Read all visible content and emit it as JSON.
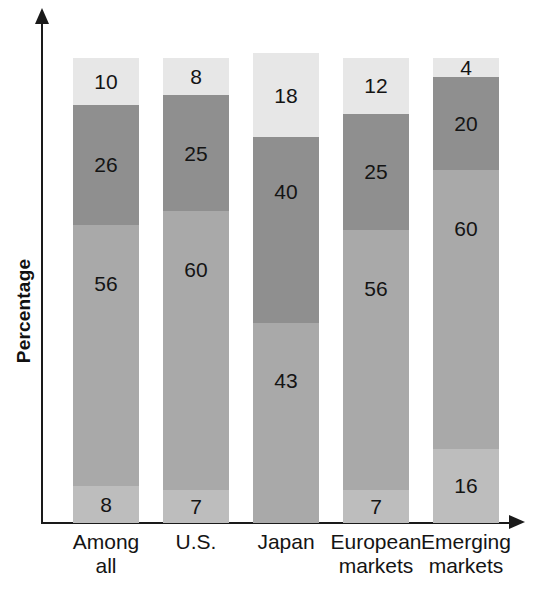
{
  "chart": {
    "type": "bar",
    "title": "",
    "ylabel": "Percentage",
    "xlabel": ""
  },
  "chart_data": {
    "type": "bar",
    "title": "",
    "xlabel": "",
    "ylabel": "Percentage",
    "ylim": [
      0,
      100
    ],
    "grid": false,
    "legend": "none",
    "stacked": true,
    "categories": [
      "Among\nall",
      "U.S.",
      "Japan",
      "European\nmarkets",
      "Emerging\nmarkets"
    ],
    "series": [
      {
        "name": "segment-1-bottom",
        "values": [
          8,
          7,
          0,
          7,
          16
        ],
        "color": "#bdbdbd"
      },
      {
        "name": "segment-2",
        "values": [
          56,
          60,
          43,
          56,
          60
        ],
        "color": "#a9a9a9"
      },
      {
        "name": "segment-3",
        "values": [
          26,
          25,
          40,
          25,
          20
        ],
        "color": "#8f8f8f"
      },
      {
        "name": "segment-4-top",
        "values": [
          10,
          8,
          18,
          12,
          4
        ],
        "color": "#e7e7e7"
      }
    ],
    "bars": [
      {
        "category": "Among\nall",
        "line1": "Among",
        "line2": "all",
        "total": 100,
        "segments": [
          {
            "value": 10,
            "label": "10",
            "color": "#e7e7e7"
          },
          {
            "value": 26,
            "label": "26",
            "color": "#8f8f8f"
          },
          {
            "value": 56,
            "label": "56",
            "color": "#a9a9a9"
          },
          {
            "value": 8,
            "label": "8",
            "color": "#bdbdbd"
          }
        ]
      },
      {
        "category": "U.S.",
        "line1": "U.S.",
        "line2": "",
        "total": 100,
        "segments": [
          {
            "value": 8,
            "label": "8",
            "color": "#e7e7e7"
          },
          {
            "value": 25,
            "label": "25",
            "color": "#8f8f8f"
          },
          {
            "value": 60,
            "label": "60",
            "color": "#a9a9a9"
          },
          {
            "value": 7,
            "label": "7",
            "color": "#bdbdbd"
          }
        ]
      },
      {
        "category": "Japan",
        "line1": "Japan",
        "line2": "",
        "total": 101,
        "segments": [
          {
            "value": 18,
            "label": "18",
            "color": "#e7e7e7"
          },
          {
            "value": 40,
            "label": "40",
            "color": "#8f8f8f"
          },
          {
            "value": 43,
            "label": "43",
            "color": "#a9a9a9"
          }
        ]
      },
      {
        "category": "European\nmarkets",
        "line1": "European",
        "line2": "markets",
        "total": 100,
        "segments": [
          {
            "value": 12,
            "label": "12",
            "color": "#e7e7e7"
          },
          {
            "value": 25,
            "label": "25",
            "color": "#8f8f8f"
          },
          {
            "value": 56,
            "label": "56",
            "color": "#a9a9a9"
          },
          {
            "value": 7,
            "label": "7",
            "color": "#bdbdbd"
          }
        ]
      },
      {
        "category": "Emerging\nmarkets",
        "line1": "Emerging",
        "line2": "markets",
        "total": 100,
        "segments": [
          {
            "value": 4,
            "label": "4",
            "color": "#e7e7e7"
          },
          {
            "value": 20,
            "label": "20",
            "color": "#8f8f8f"
          },
          {
            "value": 60,
            "label": "60",
            "color": "#a9a9a9"
          },
          {
            "value": 16,
            "label": "16",
            "color": "#bdbdbd"
          }
        ]
      }
    ]
  },
  "axis": {
    "y_arrow": "up-arrow-icon",
    "x_arrow": "right-arrow-icon"
  }
}
